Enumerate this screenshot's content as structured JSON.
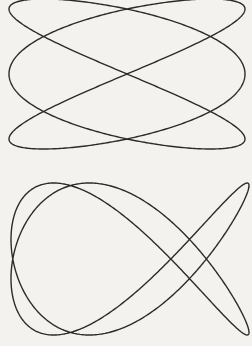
{
  "page": {
    "background": "#f3f2ef",
    "stroke_color": "#2b2b2b",
    "stroke_width": 1.4
  },
  "figures": [
    {
      "name": "lissajous-top",
      "description": "Lissajous figure, frequency ratio 3:2 (x:y)",
      "fx": 3,
      "fy": 2,
      "phase": 0.0,
      "cx": 127,
      "cy": 74,
      "ax": 118,
      "ay": 75
    },
    {
      "name": "lissajous-bottom",
      "description": "Lissajous figure, frequency ratio 2:3 (x:y) with phase shift",
      "fx": 2,
      "fy": 3,
      "phase": 0.35,
      "cx": 130,
      "cy": 259,
      "ax": 119,
      "ay": 76
    }
  ]
}
